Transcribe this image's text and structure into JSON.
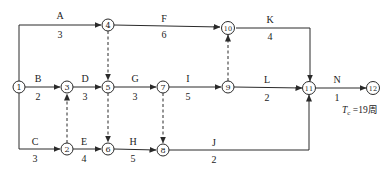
{
  "diagram": {
    "type": "activity-on-arrow network",
    "nodes": [
      {
        "id": "1",
        "label": "1",
        "x": 19,
        "y": 87
      },
      {
        "id": "2",
        "label": "2",
        "x": 67,
        "y": 149
      },
      {
        "id": "3",
        "label": "3",
        "x": 67,
        "y": 87
      },
      {
        "id": "4",
        "label": "4",
        "x": 108,
        "y": 25
      },
      {
        "id": "5",
        "label": "5",
        "x": 108,
        "y": 87
      },
      {
        "id": "6",
        "label": "6",
        "x": 108,
        "y": 149
      },
      {
        "id": "7",
        "label": "7",
        "x": 163,
        "y": 87
      },
      {
        "id": "8",
        "label": "8",
        "x": 163,
        "y": 150
      },
      {
        "id": "9",
        "label": "9",
        "x": 228,
        "y": 87
      },
      {
        "id": "10",
        "label": "10",
        "x": 228,
        "y": 28
      },
      {
        "id": "11",
        "label": "11",
        "x": 309,
        "y": 88
      },
      {
        "id": "12",
        "label": "12",
        "x": 373,
        "y": 88
      }
    ],
    "activities": [
      {
        "name": "A",
        "duration": "3",
        "from": "1",
        "to": "4"
      },
      {
        "name": "B",
        "duration": "2",
        "from": "1",
        "to": "3"
      },
      {
        "name": "C",
        "duration": "3",
        "from": "1",
        "to": "2"
      },
      {
        "name": "D",
        "duration": "3",
        "from": "3",
        "to": "5"
      },
      {
        "name": "E",
        "duration": "4",
        "from": "2",
        "to": "6"
      },
      {
        "name": "F",
        "duration": "6",
        "from": "4",
        "to": "10"
      },
      {
        "name": "G",
        "duration": "3",
        "from": "5",
        "to": "7"
      },
      {
        "name": "H",
        "duration": "5",
        "from": "6",
        "to": "8"
      },
      {
        "name": "I",
        "duration": "5",
        "from": "7",
        "to": "9"
      },
      {
        "name": "J",
        "duration": "2",
        "from": "8",
        "to": "11"
      },
      {
        "name": "K",
        "duration": "4",
        "from": "10",
        "to": "11"
      },
      {
        "name": "L",
        "duration": "2",
        "from": "9",
        "to": "11"
      },
      {
        "name": "N",
        "duration": "1",
        "from": "11",
        "to": "12"
      }
    ],
    "dummy_activities": [
      {
        "from": "2",
        "to": "3"
      },
      {
        "from": "4",
        "to": "5"
      },
      {
        "from": "5",
        "to": "6"
      },
      {
        "from": "7",
        "to": "8"
      },
      {
        "from": "9",
        "to": "10"
      }
    ],
    "annotation": {
      "symbol": "T",
      "subscript": "c",
      "text": " =19周"
    }
  }
}
